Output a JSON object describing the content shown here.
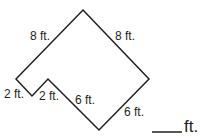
{
  "problem": {
    "description": "Find the perimeter of the figure",
    "side_labels": {
      "top_left": "8 ft.",
      "top_right": "8 ft.",
      "notch_left": "2 ft.",
      "notch_right": "2 ft.",
      "bottom_left": "6 ft.",
      "bottom_right": "6 ft."
    },
    "answer_unit": "ft.",
    "answer_value": ""
  }
}
